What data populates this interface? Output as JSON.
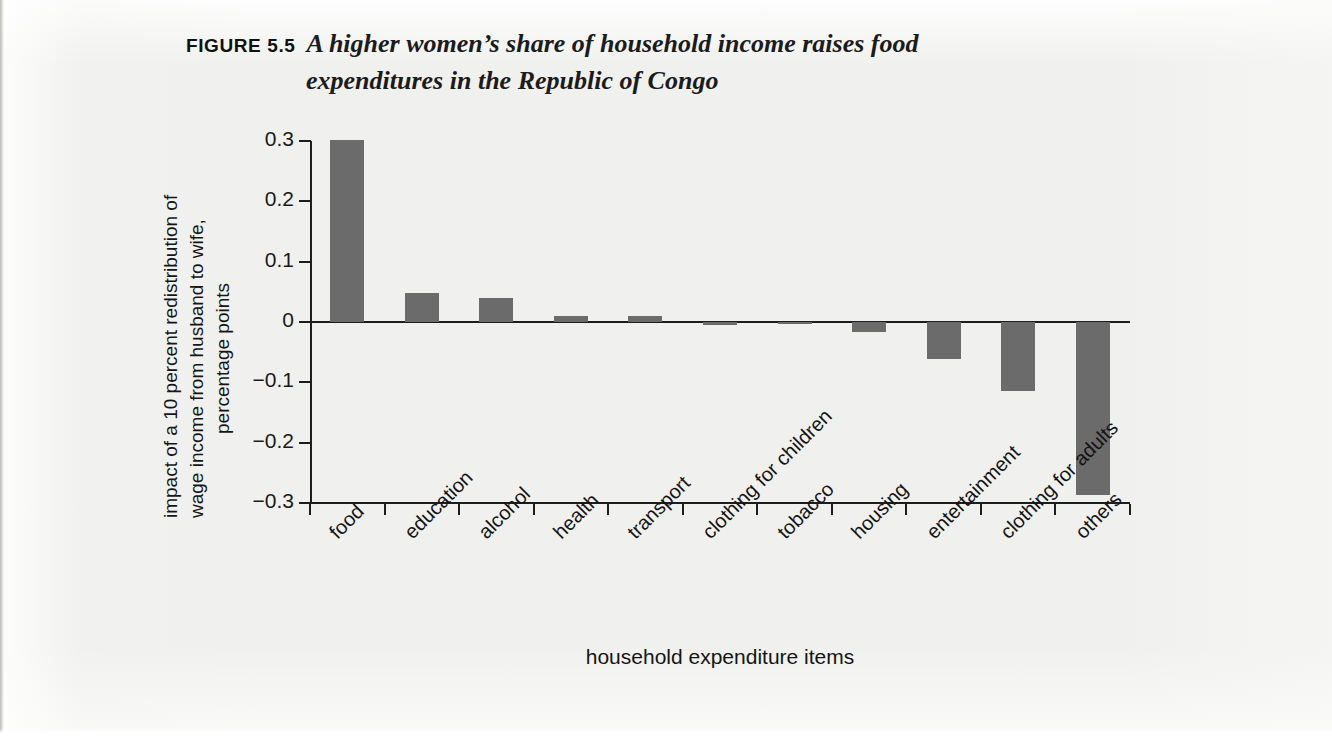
{
  "figure": {
    "label": "FIGURE 5.5",
    "title_line_1": "A higher women’s share of household income raises food",
    "title_line_2": "expenditures in the Republic of Congo"
  },
  "axis": {
    "x_title": "household expenditure items",
    "y_title_line_1": "impact of a 10 percent redistribution of",
    "y_title_line_2": "wage income from husband to wife,",
    "y_title_line_3": "percentage points"
  },
  "colors": {
    "bar": "#6b6b6b",
    "axis": "#1d1d1d",
    "paper": "#f0f0ee",
    "text": "#151515"
  },
  "chart_data": {
    "type": "bar",
    "title": "A higher women’s share of household income raises food expenditures in the Republic of Congo",
    "xlabel": "household expenditure items",
    "ylabel": "impact of a 10 percent redistribution of wage income from husband to wife, percentage points",
    "ylim": [
      -0.3,
      0.3
    ],
    "yticks": [
      0.3,
      0.2,
      0.1,
      0,
      -0.1,
      -0.2,
      -0.3
    ],
    "ytick_labels": [
      "0.3",
      "0.2",
      "0.1",
      "0",
      "−0.1",
      "−0.2",
      "−0.3"
    ],
    "grid": false,
    "legend": "none",
    "categories": [
      "food",
      "education",
      "alcohol",
      "health",
      "transport",
      "clothing for children",
      "tobacco",
      "housing",
      "entertainment",
      "clothing for adults",
      "others"
    ],
    "values": [
      0.302,
      0.048,
      0.04,
      0.01,
      0.01,
      -0.005,
      -0.004,
      -0.016,
      -0.061,
      -0.115,
      -0.287
    ]
  }
}
